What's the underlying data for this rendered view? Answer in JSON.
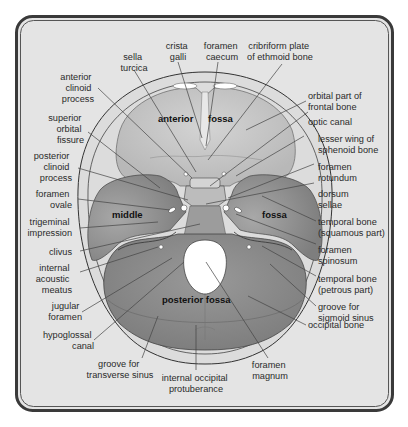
{
  "colors": {
    "background": "#ffffff",
    "panel": "#e4e4e4",
    "frame": "#3a3a3a",
    "bone_rim": "#dcdcdc",
    "anterior_fossa": "#c9c9c9",
    "middle_fossa": "#9a9a9a",
    "posterior_fossa": "#8c8c8c",
    "foramen": "#ffffff",
    "text": "#2a2a2a"
  },
  "regions": {
    "anterior": "anterior",
    "anterior_fossa": "fossa",
    "middle": "middle",
    "middle_fossa": "fossa",
    "posterior": "posterior fossa"
  },
  "labels_top": [
    {
      "id": "sella-turcica",
      "lines": [
        "sella",
        "turcica"
      ]
    },
    {
      "id": "crista-galli",
      "lines": [
        "crista",
        "galli"
      ]
    },
    {
      "id": "foramen-caecum",
      "lines": [
        "foramen",
        "caecum"
      ]
    },
    {
      "id": "cribriform-plate",
      "lines": [
        "cribriform plate",
        "of ethmoid bone"
      ]
    }
  ],
  "labels_left": [
    {
      "id": "anterior-clinoid-process",
      "lines": [
        "anterior",
        "clinoid",
        "process"
      ]
    },
    {
      "id": "superior-orbital-fissure",
      "lines": [
        "superior",
        "orbital",
        "fissure"
      ]
    },
    {
      "id": "posterior-clinoid-process",
      "lines": [
        "posterior",
        "clinoid",
        "process"
      ]
    },
    {
      "id": "foramen-ovale",
      "lines": [
        "foramen",
        "ovale"
      ]
    },
    {
      "id": "trigeminal-impression",
      "lines": [
        "trigeminal",
        "impression"
      ]
    },
    {
      "id": "clivus",
      "lines": [
        "clivus"
      ]
    },
    {
      "id": "internal-acoustic-meatus",
      "lines": [
        "internal",
        "acoustic",
        "meatus"
      ]
    },
    {
      "id": "jugular-foramen",
      "lines": [
        "jugular",
        "foramen"
      ]
    },
    {
      "id": "hypoglossal-canal",
      "lines": [
        "hypoglossal",
        "canal"
      ]
    }
  ],
  "labels_right": [
    {
      "id": "orbital-part-frontal-bone",
      "lines": [
        "orbital part of",
        "frontal bone"
      ]
    },
    {
      "id": "optic-canal",
      "lines": [
        "optic canal"
      ]
    },
    {
      "id": "lesser-wing-sphenoid",
      "lines": [
        "lesser wing of",
        "sphenoid bone"
      ]
    },
    {
      "id": "foramen-rotundum",
      "lines": [
        "foramen",
        "rotundum"
      ]
    },
    {
      "id": "dorsum-sellae",
      "lines": [
        "dorsum",
        "sellae"
      ]
    },
    {
      "id": "temporal-bone-squamous",
      "lines": [
        "temporal bone",
        "(squamous part)"
      ]
    },
    {
      "id": "foramen-spinosum",
      "lines": [
        "foramen",
        "spinosum"
      ]
    },
    {
      "id": "temporal-bone-petrous",
      "lines": [
        "temporal bone",
        "(petrous part)"
      ]
    },
    {
      "id": "groove-sigmoid-sinus",
      "lines": [
        "groove for",
        "sigmoid sinus"
      ]
    },
    {
      "id": "occipital-bone",
      "lines": [
        "occipital bone"
      ]
    }
  ],
  "labels_bottom": [
    {
      "id": "groove-transverse-sinus",
      "lines": [
        "groove for",
        "transverse sinus"
      ]
    },
    {
      "id": "internal-occipital-protuberance",
      "lines": [
        "internal occipital",
        "protuberance"
      ]
    },
    {
      "id": "foramen-magnum",
      "lines": [
        "foramen",
        "magnum"
      ]
    }
  ]
}
